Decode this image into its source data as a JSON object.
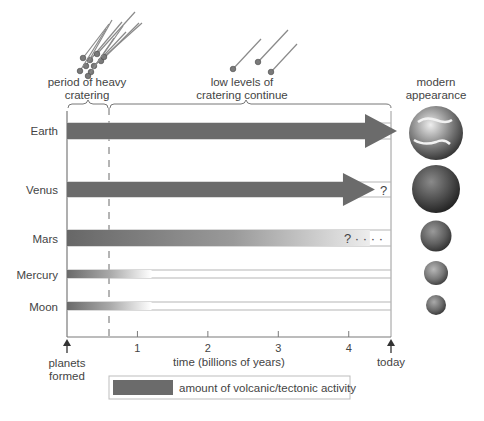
{
  "diagram": {
    "period_labels": {
      "heavy": [
        "period of heavy",
        "cratering"
      ],
      "low": [
        "low levels of",
        "cratering continue"
      ],
      "modern": [
        "modern",
        "appearance"
      ]
    },
    "time_axis": {
      "title": "time (billions of years)",
      "ticks": [
        "1",
        "2",
        "3",
        "4"
      ],
      "tick_values": [
        1,
        2,
        3,
        4
      ],
      "start_value": 0,
      "end_value": 4.6,
      "heavy_cratering_end": 0.6,
      "start_label": [
        "planets",
        "formed"
      ],
      "end_label": "today"
    },
    "bodies": [
      {
        "name": "Earth",
        "activity_type": "arrow-full",
        "activity_until": 4.6,
        "uncertain": false,
        "marker": ""
      },
      {
        "name": "Venus",
        "activity_type": "arrow-uncertain",
        "activity_until": 4.5,
        "uncertain": true,
        "marker": "?"
      },
      {
        "name": "Mars",
        "activity_type": "fade-long",
        "activity_until": 4.3,
        "uncertain": true,
        "marker": "? · · · ·"
      },
      {
        "name": "Mercury",
        "activity_type": "fade-short",
        "activity_until": 1.2,
        "uncertain": false,
        "marker": ""
      },
      {
        "name": "Moon",
        "activity_type": "fade-short",
        "activity_until": 1.2,
        "uncertain": false,
        "marker": ""
      }
    ],
    "legend": {
      "label": "amount of volcanic/tectonic activity",
      "color": "#6b6b6b"
    },
    "colors": {
      "activity": "#6b6b6b",
      "axis": "#8a8a8a",
      "text": "#444444"
    }
  }
}
